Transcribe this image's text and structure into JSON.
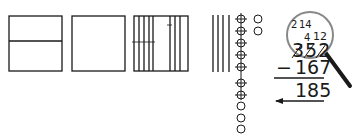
{
  "diagram": {
    "colors": {
      "stroke": "#1a1a1a",
      "magnifier_rim": "#888888",
      "handle": "#1a1a1a"
    },
    "blocks": {
      "hundreds_flats": [
        {
          "id": "flat-1",
          "state": "split",
          "divider": "horizontal"
        },
        {
          "id": "flat-2",
          "state": "whole"
        },
        {
          "id": "flat-3",
          "state": "decomposed_into_tens",
          "tens_count": 8
        }
      ],
      "tens_rods": {
        "count": 4
      },
      "ones_units": {
        "crossed_out": 10,
        "remaining": 2
      }
    },
    "problem": {
      "minuend": "352",
      "subtrahend": "167",
      "operator": "−",
      "result": "185",
      "regroup_marks": {
        "hundreds": "2",
        "tens": "14",
        "tens_crossed": "4",
        "ones": "12"
      }
    },
    "magnifier": {
      "icon": "magnifying-glass-icon"
    },
    "arrow": {
      "direction": "left"
    }
  }
}
